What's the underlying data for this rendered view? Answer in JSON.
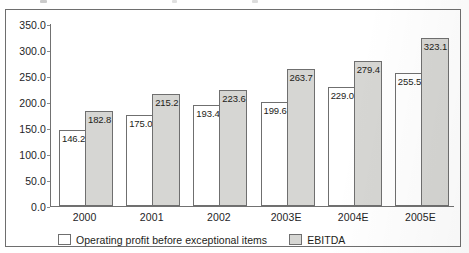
{
  "figure": {
    "frame_border_color": "#6e6e6e",
    "background": "#ffffff"
  },
  "chart_data": {
    "type": "bar",
    "title": "",
    "subtitle": "",
    "xlabel": "",
    "ylabel": "",
    "categories": [
      "2000",
      "2001",
      "2002",
      "2003E",
      "2004E",
      "2005E"
    ],
    "series": [
      {
        "name": "Operating profit before exceptional items",
        "color": "#ffffff",
        "border_color": "#6f6f6f",
        "values": [
          146.2,
          175.0,
          193.4,
          199.6,
          229.0,
          255.5
        ],
        "labels": [
          "146.2",
          "175.0",
          "193.4",
          "199.6",
          "229.0",
          "255.5"
        ]
      },
      {
        "name": "EBITDA",
        "color": "#d6d6d3",
        "border_color": "#6f6f6f",
        "values": [
          182.8,
          215.2,
          223.6,
          263.7,
          279.4,
          323.1
        ],
        "labels": [
          "182.8",
          "215.2",
          "223.6",
          "263.7",
          "279.4",
          "323.1"
        ]
      }
    ],
    "ylim": [
      0,
      350
    ],
    "ytick_values": [
      350,
      300,
      250,
      200,
      150,
      100,
      50,
      0
    ],
    "ytick_labels": [
      "350.0",
      "300.0",
      "250.0",
      "200.0",
      "150.0",
      "100.0",
      "50.0",
      "0.0"
    ],
    "grid": false,
    "legend_position": "bottom-left",
    "data_labels": "inside-top-of-bar"
  },
  "legend": {
    "entries": [
      {
        "label": "Operating profit before exceptional items",
        "swatch": "white-square-icon"
      },
      {
        "label": "EBITDA",
        "swatch": "gray-square-icon"
      }
    ]
  }
}
